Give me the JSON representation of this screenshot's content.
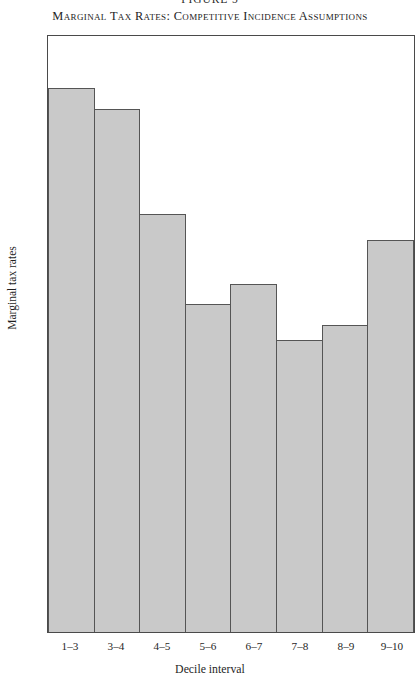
{
  "figure_number": "FIGURE 5",
  "chart_data": {
    "type": "bar",
    "title": "Marginal Tax Rates:  Competitive Incidence Assumptions",
    "xlabel": "Decile interval",
    "ylabel": "Marginal tax rates",
    "categories": [
      "1–3",
      "3–4",
      "4–5",
      "5–6",
      "6–7",
      "7–8",
      "8–9",
      "9–10"
    ],
    "values": [
      63.7,
      61.2,
      48.9,
      38.4,
      40.7,
      34.2,
      35.9,
      45.9
    ],
    "ylim": [
      0,
      70
    ],
    "yticks": [
      0,
      10,
      20,
      30,
      40,
      50,
      60,
      70
    ],
    "ytick_labels": [
      "0",
      "10",
      "20",
      "30",
      "40",
      "50",
      "60",
      "70"
    ],
    "grid": false,
    "legend": null,
    "bar_color": "#c9c9c9",
    "bar_edge_color": "#555555",
    "axis_color": "#4a4a4a"
  }
}
